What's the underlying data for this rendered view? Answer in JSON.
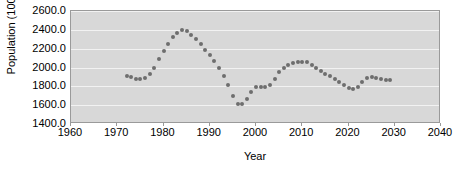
{
  "chart_data": {
    "type": "scatter",
    "title": "",
    "xlabel": "Year",
    "ylabel": "Population (1000)",
    "xlim": [
      1960,
      2040
    ],
    "ylim": [
      1400.0,
      2600.0
    ],
    "xticks": [
      1960,
      1970,
      1980,
      1990,
      2000,
      2010,
      2020,
      2030,
      2040
    ],
    "xtick_labels": [
      "1960",
      "1970",
      "1980",
      "1990",
      "2000",
      "2010",
      "2020",
      "2030",
      "2040"
    ],
    "yticks": [
      1400.0,
      1600.0,
      1800.0,
      2000.0,
      2200.0,
      2400.0,
      2600.0
    ],
    "ytick_labels": [
      "1400.0",
      "1600.0",
      "1800.0",
      "2000.0",
      "2200.0",
      "2400.0",
      "2600.0"
    ],
    "grid": true,
    "grid_axis": "y",
    "legend": false,
    "plot_background": "#d8d8d8",
    "gridline_color": "#f2f2f2",
    "marker_color": "#6e6e6e",
    "marker_shape": "circle",
    "series": [
      {
        "name": "Population",
        "x": [
          1972,
          1973,
          1974,
          1975,
          1976,
          1977,
          1978,
          1979,
          1980,
          1981,
          1982,
          1983,
          1984,
          1985,
          1986,
          1987,
          1988,
          1989,
          1990,
          1991,
          1992,
          1993,
          1994,
          1995,
          1996,
          1997,
          1998,
          1999,
          2000,
          2001,
          2002,
          2003,
          2004,
          2005,
          2006,
          2007,
          2008,
          2009,
          2010,
          2011,
          2012,
          2013,
          2014,
          2015,
          2016,
          2017,
          2018,
          2019,
          2020,
          2021,
          2022,
          2023,
          2024,
          2025,
          2026,
          2027,
          2028,
          2029
        ],
        "y": [
          1910,
          1895,
          1880,
          1880,
          1890,
          1935,
          2000,
          2085,
          2170,
          2250,
          2320,
          2370,
          2395,
          2390,
          2350,
          2300,
          2245,
          2190,
          2130,
          2065,
          1990,
          1905,
          1810,
          1700,
          1615,
          1610,
          1665,
          1740,
          1790,
          1790,
          1795,
          1815,
          1880,
          1950,
          2000,
          2030,
          2050,
          2060,
          2060,
          2055,
          2030,
          1995,
          1960,
          1935,
          1905,
          1875,
          1845,
          1810,
          1785,
          1775,
          1790,
          1845,
          1885,
          1895,
          1890,
          1880,
          1872,
          1870
        ]
      }
    ]
  }
}
